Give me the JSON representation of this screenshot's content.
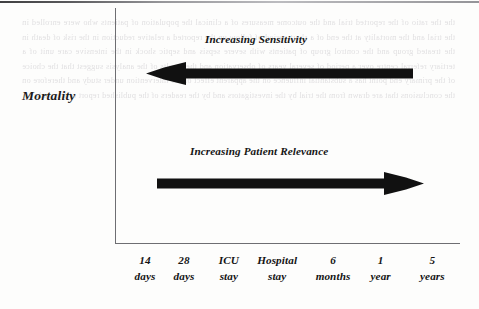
{
  "figure": {
    "y_axis_label": "Mortality",
    "top_arrow": {
      "caption": "Increasing Sensitivity",
      "direction": "left",
      "color": "#111111"
    },
    "bottom_arrow": {
      "caption": "Increasing Patient Relevance",
      "direction": "right",
      "color": "#111111"
    },
    "x_axis_ticks": [
      {
        "line1": "14",
        "line2": "days",
        "x_pct": 8.7
      },
      {
        "line1": "28",
        "line2": "days",
        "x_pct": 20.0
      },
      {
        "line1": "ICU",
        "line2": "stay",
        "x_pct": 33.0
      },
      {
        "line1": "Hospital",
        "line2": "stay",
        "x_pct": 47.0
      },
      {
        "line1": "6",
        "line2": "months",
        "x_pct": 63.2
      },
      {
        "line1": "1",
        "line2": "year",
        "x_pct": 77.0
      },
      {
        "line1": "5",
        "line2": "years",
        "x_pct": 92.0
      }
    ],
    "axis_color": "#6e6e72",
    "background_color": "#fdfdfc"
  },
  "scan_artifacts": {
    "top_rule_color": "#4a4a4d",
    "bleed_through_text": "the the ratio of the reported trial and the outcome measures of a clinical the population of patients who were enrolled in the trial and the mortality at the end of a short period of follow up the reported a relative reduction in the risk of death in the treated group and the control group of patients with severe sepsis and septic shock in the intensive care unit of a tertiary referral centre over a period of several years of observation and the results of the analysis suggest that the choice of the primary end point has a substantial influence on the apparent effect of the intervention under study and therefore on the conclusions that are drawn from the trial by the investigators and by the readers of the published report of the study"
  }
}
